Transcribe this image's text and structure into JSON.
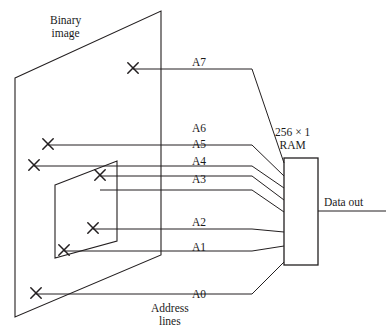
{
  "figure": {
    "binary_image_label": "Binary\nimage",
    "ram_label": "256 × 1\nRAM",
    "data_out_label": "Data out",
    "address_lines_label": "Address\nlines",
    "stroke_color": "#231f20",
    "background_color": "#ffffff"
  },
  "address_lines": [
    {
      "name": "A7",
      "label": "A7",
      "label_x": 192,
      "label_y": 56,
      "marker_x": 133,
      "marker_y": 68,
      "line_y": 69,
      "ram_y": 163
    },
    {
      "name": "A6",
      "label": "A6",
      "label_x": 192,
      "label_y": 122,
      "marker_x": 48,
      "marker_y": 144,
      "line_y": 145,
      "ram_y": 176
    },
    {
      "name": "A5",
      "label": "A5",
      "label_x": 192,
      "label_y": 138,
      "marker_x": 34,
      "marker_y": 165,
      "line_y": 166,
      "ram_y": 188
    },
    {
      "name": "A4",
      "label": "A4",
      "label_x": 192,
      "label_y": 155,
      "marker_x": 100,
      "marker_y": 175,
      "line_y": 176,
      "ram_y": 200
    },
    {
      "name": "A3",
      "label": "A3",
      "label_x": 192,
      "label_y": 173,
      "marker_x": 100,
      "marker_y": 175,
      "line_y": 190,
      "ram_y": 212
    },
    {
      "name": "A2",
      "label": "A2",
      "label_x": 192,
      "label_y": 216,
      "marker_x": 93,
      "marker_y": 228,
      "line_y": 229,
      "ram_y": 232
    },
    {
      "name": "A1",
      "label": "A1",
      "label_x": 192,
      "label_y": 241,
      "marker_x": 64,
      "marker_y": 250,
      "line_y": 251,
      "ram_y": 246
    },
    {
      "name": "A0",
      "label": "A0",
      "label_x": 192,
      "label_y": 288,
      "marker_x": 36,
      "marker_y": 293,
      "line_y": 294,
      "ram_y": 262
    }
  ],
  "markers": [
    {
      "name": "sample-point-a7",
      "x": 133,
      "y": 68
    },
    {
      "name": "sample-point-a6",
      "x": 48,
      "y": 144
    },
    {
      "name": "sample-point-a5",
      "x": 34,
      "y": 165
    },
    {
      "name": "sample-point-a4-a3",
      "x": 100,
      "y": 175
    },
    {
      "name": "sample-point-a2",
      "x": 93,
      "y": 228
    },
    {
      "name": "sample-point-a1",
      "x": 64,
      "y": 250
    },
    {
      "name": "sample-point-a0",
      "x": 36,
      "y": 293
    }
  ],
  "shapes": {
    "image_plane": "15,78 161,11 161,255 15,317",
    "window_plane": "55,185 117,161 117,241 55,258",
    "ram_box": {
      "x": 284,
      "y": 158,
      "width": 34,
      "height": 107
    },
    "data_out_line": {
      "x1": 318,
      "y1": 211,
      "x2": 386,
      "y2": 211
    }
  },
  "text_positions": {
    "binary_image": {
      "x": 50,
      "y": 14
    },
    "ram": {
      "x": 275,
      "y": 126
    },
    "data_out": {
      "x": 324,
      "y": 196
    },
    "address_lines": {
      "x": 151,
      "y": 302
    }
  }
}
